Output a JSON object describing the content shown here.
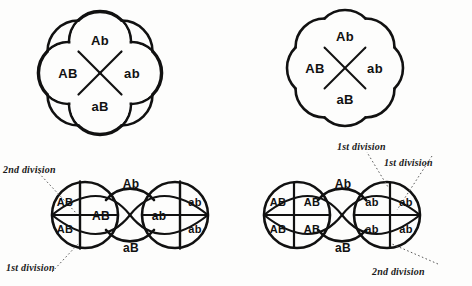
{
  "figures": {
    "top_left": {
      "name": "tetrad-no-crossover-left",
      "cells": {
        "top": "Ab",
        "left": "AB",
        "right": "ab",
        "bottom": "aB"
      }
    },
    "top_right": {
      "name": "tetrad-no-crossover-right",
      "cells": {
        "top": "Ab",
        "left": "AB",
        "right": "ab",
        "bottom": "aB"
      }
    },
    "bottom_left": {
      "name": "tetrad-divided-left",
      "cells": {
        "top": "Ab",
        "bottom": "aB",
        "center_left": "AB",
        "center_right": "ab",
        "left_upper": "AB",
        "left_lower": "AB",
        "right_upper": "ab",
        "right_lower": "ab"
      },
      "annotations": [
        {
          "label_ordinal": "2nd",
          "label_rest": "division"
        },
        {
          "label_ordinal": "1st",
          "label_rest": "division"
        }
      ]
    },
    "bottom_right": {
      "name": "tetrad-divided-right",
      "cells": {
        "top": "Ab",
        "bottom": "aB",
        "left_outer_upper": "AB",
        "left_inner_upper": "AB",
        "left_outer_lower": "AB",
        "left_inner_lower": "AB",
        "right_inner_upper": "ab",
        "right_outer_upper": "ab",
        "right_inner_lower": "ab",
        "right_outer_lower": "ab"
      },
      "annotations": [
        {
          "label_ordinal": "1st",
          "label_rest": "division"
        },
        {
          "label_ordinal": "1st",
          "label_rest": "division"
        },
        {
          "label_ordinal": "2nd",
          "label_rest": "division"
        }
      ]
    }
  },
  "colors": {
    "stroke": "#111111",
    "background": "#fdfdfc",
    "text": "#111111",
    "leader": "#555555"
  }
}
